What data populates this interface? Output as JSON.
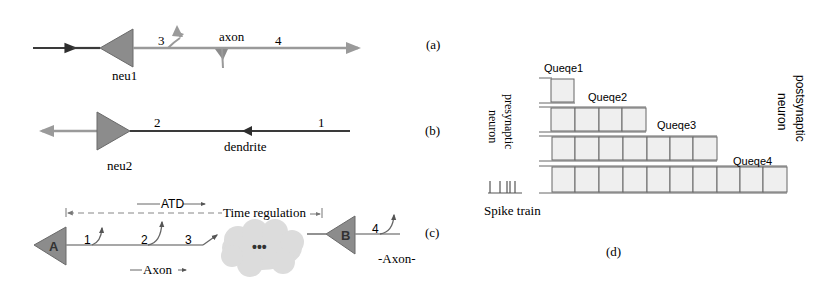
{
  "panels": {
    "a": {
      "label": "(a)",
      "neuron": "neu1",
      "axon_label": "axon",
      "point_3": "3",
      "point_4": "4"
    },
    "b": {
      "label": "(b)",
      "neuron": "neu2",
      "dendrite_label": "dendrite",
      "point_2": "2",
      "point_1": "1"
    },
    "c": {
      "label": "(c)",
      "neuron_a": "A",
      "neuron_b": "B",
      "atd_label": "ATD",
      "time_regulation": "Time regulation",
      "axon_label_left": "Axon",
      "axon_label_right": "-Axon-",
      "point_1": "1",
      "point_2": "2",
      "point_3": "3",
      "point_4": "4",
      "cloud_text": "•••"
    },
    "d": {
      "label": "(d)",
      "presynaptic_line1": "presynaptic",
      "presynaptic_line2": "neuron",
      "postsynaptic_line1": "postsynaptic",
      "postsynaptic_line2": "neuron",
      "spike_train": "Spike train",
      "queues": [
        {
          "name": "Queqe1",
          "cells": 1
        },
        {
          "name": "Queqe2",
          "cells": 4
        },
        {
          "name": "Queqe3",
          "cells": 7
        },
        {
          "name": "Queqe4",
          "cells": 10
        }
      ]
    }
  },
  "colors": {
    "dark_line": "#3a3a3a",
    "light_line": "#9a9a9a",
    "neuron_fill": "#8c8c8c",
    "cell_fill": "#efefef",
    "cloud_fill": "#dcdcdc"
  }
}
